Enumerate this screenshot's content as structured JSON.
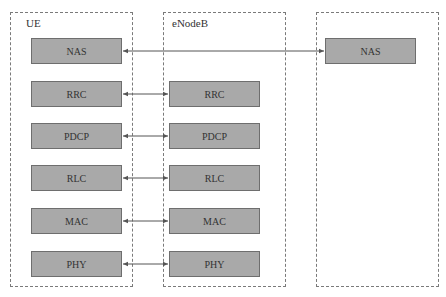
{
  "containers": {
    "ue": {
      "label": "UE"
    },
    "enodeb": {
      "label": "eNodeB"
    },
    "core": {
      "label": ""
    }
  },
  "ue_layers": [
    "NAS",
    "RRC",
    "PDCP",
    "RLC",
    "MAC",
    "PHY"
  ],
  "enodeb_layers": [
    "RRC",
    "PDCP",
    "RLC",
    "MAC",
    "PHY"
  ],
  "core_layers": [
    "NAS"
  ],
  "colors": {
    "layer_fill": "#a9a9a9",
    "layer_border": "#6e6e6e",
    "dashed_border": "#7a7a7a",
    "arrow": "#555555"
  }
}
